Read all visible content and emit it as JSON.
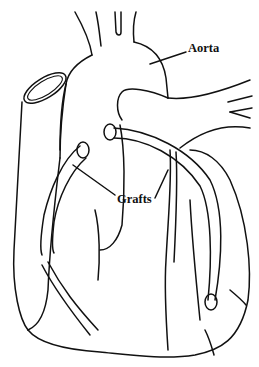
{
  "diagram": {
    "style": "black line art on white",
    "labels": {
      "aorta": "Aorta",
      "grafts": "Grafts"
    },
    "colors": {
      "line": "#111111",
      "background": "#ffffff"
    }
  }
}
